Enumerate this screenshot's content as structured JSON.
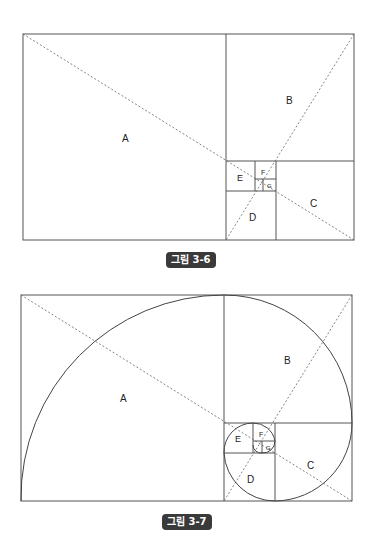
{
  "figures": [
    {
      "caption": "그림 3-6",
      "labels": {
        "A": "A",
        "B": "B",
        "C": "C",
        "D": "D",
        "E": "E",
        "F": "F",
        "G": "G"
      },
      "has_spiral": false
    },
    {
      "caption": "그림 3-7",
      "labels": {
        "A": "A",
        "B": "B",
        "C": "C",
        "D": "D",
        "E": "E",
        "F": "F",
        "G": "G"
      },
      "has_spiral": true
    }
  ],
  "colors": {
    "line": "#555555",
    "caption_bg": "#3a3a3a"
  }
}
